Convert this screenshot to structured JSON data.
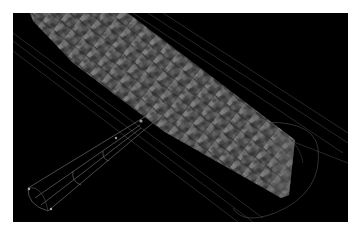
{
  "scene": {
    "background": "#ffffff",
    "viewport_background": "#000000",
    "description": "3D render of a granular packed bed column with wireframe cylindrical container and a tapered wireframe inlet tube",
    "colors": {
      "grain_fill": "#5a5a5a",
      "grain_light": "#8a8a8a",
      "grain_dark": "#2c2c2c",
      "wireframe": "#6e6e6e"
    }
  }
}
